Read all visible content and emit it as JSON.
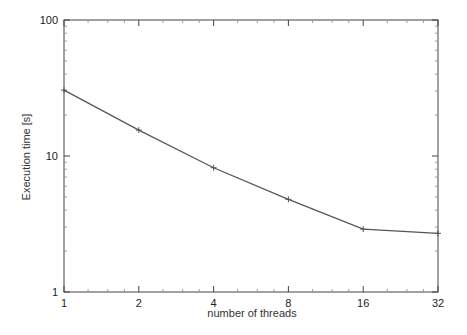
{
  "chart_data": {
    "type": "line",
    "title": "",
    "xlabel": "number of threads",
    "ylabel": "Execution time [s]",
    "xscale": "log2",
    "yscale": "log10",
    "xlim": [
      1,
      32
    ],
    "ylim": [
      1,
      100
    ],
    "grid": false,
    "legend": null,
    "x_ticks": [
      "1",
      "2",
      "4",
      "8",
      "16",
      "32"
    ],
    "y_ticks": [
      "1",
      "10",
      "100"
    ],
    "x": [
      1,
      2,
      4,
      8,
      16,
      32
    ],
    "series": [
      {
        "name": "execution time",
        "values": [
          30.5,
          15.5,
          8.2,
          4.8,
          2.9,
          2.7
        ],
        "color": "#555555",
        "marker": "plus"
      }
    ]
  }
}
